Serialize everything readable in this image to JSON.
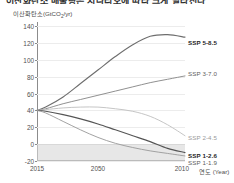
{
  "title_partial": "이산화탄소 배출량은 시나리오에 따라 크게 달라진다",
  "axes": {
    "y_caption_main": "이산화탄소(GtCO",
    "y_caption_sub": "2",
    "y_caption_tail": "/yr)",
    "y_ticks": [
      "140",
      "120",
      "100",
      "80",
      "60",
      "40",
      "20",
      "0",
      "-20"
    ],
    "x_ticks": [
      "2015",
      "2050",
      "2010"
    ],
    "x_caption": "연도 (Year)"
  },
  "chart_data": {
    "type": "line",
    "xlabel": "연도 (Year)",
    "ylabel": "이산화탄소(GtCO2/yr)",
    "xlim": [
      2015,
      2100
    ],
    "ylim": [
      -20,
      145
    ],
    "yticks": [
      -20,
      0,
      20,
      40,
      60,
      80,
      100,
      120,
      140
    ],
    "xticks": [
      2015,
      2050,
      2100
    ],
    "grid": true,
    "legend_position": "right-inline",
    "shaded_region": {
      "label": "net-negative emissions",
      "y_from": -20,
      "y_to": 0,
      "color": "#d9d9d9"
    },
    "x": [
      2015,
      2020,
      2030,
      2040,
      2050,
      2060,
      2070,
      2080,
      2090,
      2100
    ],
    "series": [
      {
        "name": "SSP 5-8.5",
        "label": "SSP 5-8.5",
        "color": "#6e6e6e",
        "emphasis": "bold",
        "values": [
          40,
          44,
          56,
          72,
          88,
          104,
          118,
          128,
          130,
          127
        ]
      },
      {
        "name": "SSP 3-7.0",
        "label": "SSP 3-7.0",
        "color": "#8a8a8a",
        "emphasis": "normal",
        "values": [
          40,
          42,
          48,
          53,
          58,
          63,
          68,
          73,
          77,
          81
        ]
      },
      {
        "name": "SSP 2-4.5",
        "label": "SSP 2-4.5",
        "color": "#c2c2c2",
        "emphasis": "light",
        "values": [
          40,
          41,
          43,
          44,
          44,
          42,
          39,
          33,
          23,
          10
        ]
      },
      {
        "name": "SSP 1-2.6",
        "label": "SSP 1-2.6",
        "color": "#555555",
        "emphasis": "bold",
        "values": [
          40,
          39,
          35,
          30,
          24,
          17,
          10,
          3,
          -5,
          -10
        ]
      },
      {
        "name": "SSP 1-1.9",
        "label": "SSP 1-1.9",
        "color": "#9d9d9d",
        "emphasis": "normal",
        "values": [
          40,
          37,
          27,
          17,
          8,
          1,
          -4,
          -8,
          -11,
          -14
        ]
      }
    ]
  },
  "labels": {
    "ssp585": "SSP 5-8.5",
    "ssp370": "SSP 3-7.0",
    "ssp245": "SSP 2-4.5",
    "ssp126": "SSP 1-2.6",
    "ssp119": "SSP 1-1.9"
  }
}
